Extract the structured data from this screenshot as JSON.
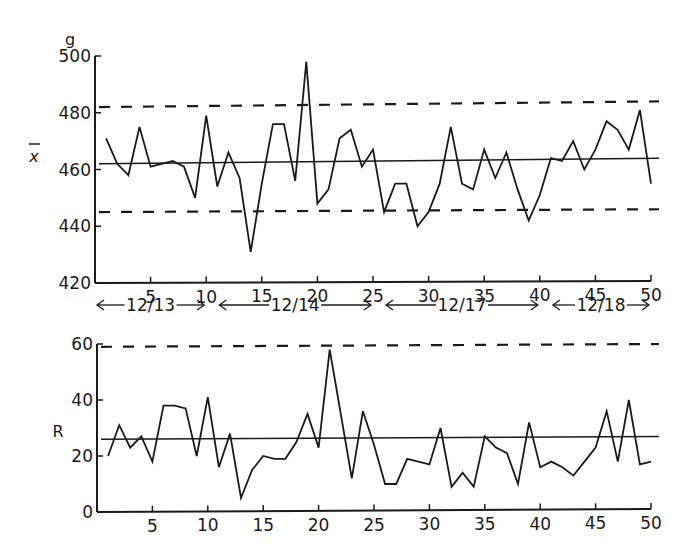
{
  "chart_data": [
    {
      "type": "line",
      "title": "X-bar control chart",
      "unit_label": "g",
      "ylabel": "X̄",
      "xlabel": "",
      "ylim": [
        420,
        500
      ],
      "yticks": [
        420,
        440,
        460,
        480,
        500
      ],
      "xlim": [
        0,
        50
      ],
      "xticks": [
        5,
        10,
        15,
        20,
        25,
        30,
        35,
        40,
        45,
        50
      ],
      "grid": false,
      "x": [
        1,
        2,
        3,
        4,
        5,
        6,
        7,
        8,
        9,
        10,
        11,
        12,
        13,
        14,
        15,
        16,
        17,
        18,
        19,
        20,
        21,
        22,
        23,
        24,
        25,
        26,
        27,
        28,
        29,
        30,
        31,
        32,
        33,
        34,
        35,
        36,
        37,
        38,
        39,
        40,
        41,
        42,
        43,
        44,
        45,
        46,
        47,
        48,
        49,
        50
      ],
      "series": [
        {
          "name": "X-bar",
          "values": [
            471,
            462,
            458,
            475,
            461,
            462,
            463,
            461,
            450,
            479,
            454,
            466,
            457,
            431,
            455,
            476,
            476,
            456,
            498,
            448,
            453,
            471,
            474,
            461,
            467,
            445,
            455,
            455,
            440,
            445,
            455,
            475,
            455,
            453,
            467,
            457,
            466,
            453,
            442,
            451,
            464,
            463,
            470,
            460,
            467,
            477,
            474,
            467,
            481,
            455
          ]
        }
      ],
      "control_lines": {
        "UCL": {
          "start": 482,
          "end": 484,
          "style": "dashed"
        },
        "CL": {
          "start": 462,
          "end": 464,
          "style": "solid"
        },
        "LCL": {
          "start": 445,
          "end": 446,
          "style": "dashed"
        }
      },
      "date_groups": [
        {
          "label": "12/13",
          "from": 0,
          "to": 10
        },
        {
          "label": "12/14",
          "from": 11,
          "to": 25
        },
        {
          "label": "12/17",
          "from": 26,
          "to": 40
        },
        {
          "label": "12/18",
          "from": 41,
          "to": 50
        }
      ]
    },
    {
      "type": "line",
      "title": "R control chart",
      "ylabel": "R",
      "xlabel": "",
      "ylim": [
        0,
        60
      ],
      "yticks": [
        0,
        20,
        40,
        60
      ],
      "xlim": [
        0,
        50
      ],
      "xticks": [
        5,
        10,
        15,
        20,
        25,
        30,
        35,
        40,
        45,
        50
      ],
      "grid": false,
      "x": [
        1,
        2,
        3,
        4,
        5,
        6,
        7,
        8,
        9,
        10,
        11,
        12,
        13,
        14,
        15,
        16,
        17,
        18,
        19,
        20,
        21,
        22,
        23,
        24,
        25,
        26,
        27,
        28,
        29,
        30,
        31,
        32,
        33,
        34,
        35,
        36,
        37,
        38,
        39,
        40,
        41,
        42,
        43,
        44,
        45,
        46,
        47,
        48,
        49,
        50
      ],
      "series": [
        {
          "name": "R",
          "values": [
            20,
            31,
            23,
            27,
            18,
            38,
            38,
            37,
            20,
            41,
            16,
            28,
            5,
            15,
            20,
            19,
            19,
            25,
            35,
            23,
            58,
            35,
            12,
            36,
            24,
            10,
            10,
            19,
            18,
            17,
            30,
            9,
            14,
            9,
            27,
            23,
            21,
            10,
            32,
            16,
            18,
            16,
            13,
            18,
            23,
            36,
            18,
            40,
            17,
            18
          ]
        }
      ],
      "control_lines": {
        "UCL": {
          "start": 59,
          "end": 60,
          "style": "dashed"
        },
        "CL": {
          "start": 26,
          "end": 27,
          "style": "solid"
        }
      }
    }
  ],
  "labels": {
    "unit": "g",
    "xbar": "x",
    "r": "R"
  }
}
